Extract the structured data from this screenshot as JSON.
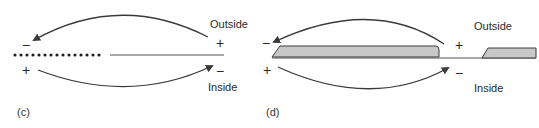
{
  "panels": [
    {
      "id": "c",
      "label": "(c)",
      "outside_label": "Outside",
      "inside_label": "Inside",
      "left_top_sign": "−",
      "left_bottom_sign": "+",
      "right_top_sign": "+",
      "right_bottom_sign": "−",
      "membrane": "dotted segment (left) followed by a thin solid line (right)"
    },
    {
      "id": "d",
      "label": "(d)",
      "outside_label": "Outside",
      "inside_label": "Inside",
      "left_top_sign": "−",
      "left_bottom_sign": "+",
      "right_top_sign": "+",
      "right_bottom_sign": "−",
      "membrane": "shaded myelin segments with a bare gap (node) between them"
    }
  ],
  "colors": {
    "stroke": "#3a3a3a",
    "myelin_fill": "#c8c8c8",
    "background": "#ffffff"
  }
}
